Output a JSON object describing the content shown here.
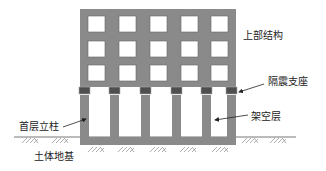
{
  "diagram": {
    "type": "structural-elevation",
    "colors": {
      "structure": "#8a8a8a",
      "bearing": "#4e4e4e",
      "window": "#ffffff",
      "ground_line": "#777777",
      "hatch": "#9a9a9a",
      "text": "#222222",
      "arrow": "#222222"
    },
    "building": {
      "window_rows": 3,
      "window_cols": 5,
      "ground_story_columns": 6
    },
    "labels": {
      "superstructure": "上部结构",
      "isolation_bearing": "隔震支座",
      "open_story": "架空层",
      "first_story_column": "首层立柱",
      "soil_foundation": "土体地基"
    }
  }
}
